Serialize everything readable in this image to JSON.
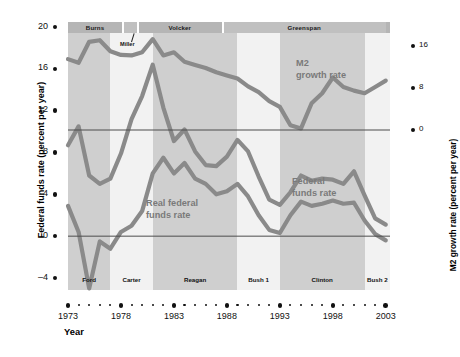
{
  "axes": {
    "x_title": "Year",
    "y_left_title": "Federal funds rate (percent per year)",
    "y_right_title": "M2 growth rate (percent per year)",
    "y_left_ticks": [
      "20",
      "16",
      "12",
      "8",
      "4",
      "0",
      "-4"
    ],
    "y_right_ticks": [
      "16",
      "8",
      "0"
    ],
    "x_ticks": [
      "1973",
      "1978",
      "1983",
      "1988",
      "1993",
      "1998",
      "2003"
    ]
  },
  "fed_chairs": [
    {
      "label": "Burns",
      "start": 1973,
      "end": 1978.1
    },
    {
      "label": "Miller",
      "start": 1978.2,
      "end": 1979.5
    },
    {
      "label": "Volcker",
      "start": 1979.6,
      "end": 1987.5
    },
    {
      "label": "Greenspan",
      "start": 1987.6,
      "end": 2003
    }
  ],
  "presidents": [
    {
      "label": "Ford",
      "start": 1973,
      "end": 1977,
      "shade": "light"
    },
    {
      "label": "Carter",
      "start": 1977,
      "end": 1981,
      "shade": "white"
    },
    {
      "label": "Reagan",
      "start": 1981,
      "end": 1989,
      "shade": "light"
    },
    {
      "label": "Bush 1",
      "start": 1989,
      "end": 1993,
      "shade": "white"
    },
    {
      "label": "Clinton",
      "start": 1993,
      "end": 2001,
      "shade": "light"
    },
    {
      "label": "Bush 2",
      "start": 2001,
      "end": 2003.4,
      "shade": "white"
    }
  ],
  "annotations": {
    "m2": "M2\ngrowth rate",
    "m2_line1": "M2",
    "m2_line2": "growth rate",
    "ffr_line1": "Federal",
    "ffr_line2": "funds rate",
    "rffr_line1": "Real federal",
    "rffr_line2": "funds rate",
    "miller": "Miller"
  },
  "colors": {
    "series": "#8a8a8a",
    "plot_bg": "#cfcfcf",
    "band_light": "#dddddd",
    "band_white": "#f2f2f2",
    "chair_strip": "#b5b5b5",
    "text": "#111111",
    "annotation_text": "#7a7a7a"
  },
  "chart_data": {
    "type": "line",
    "title": "",
    "xlabel": "Year",
    "ylabel": "Federal funds rate (percent per year)",
    "y2label": "M2 growth rate (percent per year)",
    "xlim": [
      1973,
      2003
    ],
    "ylim": [
      -4,
      20
    ],
    "y2lim": [
      -8,
      26.666
    ],
    "grid": false,
    "legend": "inline-annotations",
    "x": [
      1973,
      1974,
      1975,
      1976,
      1977,
      1978,
      1979,
      1980,
      1981,
      1982,
      1983,
      1984,
      1985,
      1986,
      1987,
      1988,
      1989,
      1990,
      1991,
      1992,
      1993,
      1994,
      1995,
      1996,
      1997,
      1998,
      1999,
      2000,
      2001,
      2002,
      2003
    ],
    "series": [
      {
        "name": "M2 growth rate",
        "axis": "right",
        "units": "percent per year",
        "values": [
          13.5,
          12.8,
          16.8,
          17.1,
          15.0,
          14.3,
          14.2,
          14.8,
          17.3,
          14.2,
          14.8,
          13.0,
          12.4,
          11.8,
          11.0,
          10.4,
          9.8,
          8.3,
          7.2,
          5.5,
          4.4,
          0.9,
          0.3,
          5.1,
          7.0,
          10.0,
          8.2,
          7.5,
          7.0,
          8.2,
          9.4
        ]
      },
      {
        "name": "Federal funds rate",
        "axis": "left",
        "units": "percent per year",
        "values": [
          8.7,
          10.5,
          5.8,
          5.0,
          5.5,
          7.9,
          11.2,
          13.4,
          16.4,
          12.3,
          9.1,
          10.2,
          8.1,
          6.8,
          6.7,
          7.6,
          9.2,
          8.1,
          5.7,
          3.5,
          3.0,
          4.2,
          5.8,
          5.3,
          5.5,
          5.4,
          5.0,
          6.2,
          3.9,
          1.7,
          1.1
        ]
      },
      {
        "name": "Real federal funds rate",
        "axis": "left",
        "units": "percent per year",
        "values": [
          2.9,
          0.4,
          -5.0,
          -0.5,
          -1.2,
          0.4,
          1.0,
          2.4,
          6.0,
          7.5,
          6.0,
          7.0,
          5.5,
          5.0,
          4.0,
          4.3,
          5.0,
          3.8,
          2.0,
          0.6,
          0.3,
          2.0,
          3.3,
          2.9,
          3.1,
          3.4,
          3.1,
          3.2,
          1.5,
          0.2,
          -0.4
        ]
      }
    ]
  }
}
